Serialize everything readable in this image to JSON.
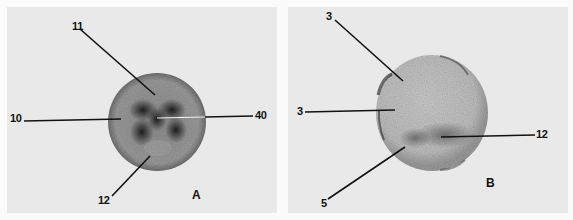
{
  "figure": {
    "panels": [
      {
        "id": "A",
        "panel_label": "A",
        "labels": [
          {
            "text": "11"
          },
          {
            "text": "10"
          },
          {
            "text": "40"
          },
          {
            "text": "12"
          }
        ]
      },
      {
        "id": "B",
        "panel_label": "B",
        "labels": [
          {
            "text": "3"
          },
          {
            "text": "3"
          },
          {
            "text": "12"
          },
          {
            "text": "5"
          }
        ]
      }
    ]
  }
}
